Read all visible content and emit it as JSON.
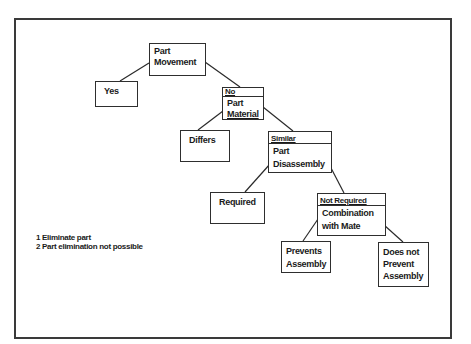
{
  "diagram": {
    "type": "decision-tree",
    "nodes": {
      "part_movement": {
        "tag": "",
        "lines": [
          "Part",
          "Movement"
        ]
      },
      "yes": {
        "tag": "",
        "lines": [
          "Yes"
        ]
      },
      "part_material": {
        "tag": "No",
        "lines": [
          "Part",
          "Material"
        ]
      },
      "differs": {
        "tag": "",
        "lines": [
          "Differs"
        ]
      },
      "part_disassembly": {
        "tag": "Similar",
        "lines": [
          "Part",
          "Disassembly"
        ]
      },
      "required": {
        "tag": "",
        "lines": [
          "Required"
        ]
      },
      "combination_with_mate": {
        "tag": "Not Required",
        "lines": [
          "Combination",
          "with Mate"
        ]
      },
      "prevents_assembly": {
        "tag": "",
        "lines": [
          "Prevents",
          "Assembly"
        ]
      },
      "does_not_prevent_assembly": {
        "tag": "",
        "lines": [
          "Does not",
          "Prevent",
          "Assembly"
        ]
      }
    },
    "edges": [
      {
        "from": "part_movement",
        "to": "yes"
      },
      {
        "from": "part_movement",
        "to": "part_material"
      },
      {
        "from": "part_material",
        "to": "differs"
      },
      {
        "from": "part_material",
        "to": "part_disassembly"
      },
      {
        "from": "part_disassembly",
        "to": "required"
      },
      {
        "from": "part_disassembly",
        "to": "combination_with_mate"
      },
      {
        "from": "combination_with_mate",
        "to": "prevents_assembly"
      },
      {
        "from": "combination_with_mate",
        "to": "does_not_prevent_assembly"
      }
    ],
    "legend": [
      "1 Eliminate part",
      "2 Part elimination not possible"
    ],
    "colors": {
      "stroke": "#2e2e2e",
      "background": "#ffffff",
      "text": "#1a1a1a"
    }
  }
}
